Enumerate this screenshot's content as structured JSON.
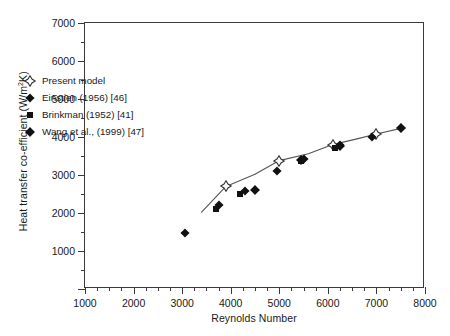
{
  "chart_data": {
    "type": "scatter",
    "title": "",
    "xlabel": "Reynolds Number",
    "ylabel": "Heat transfer co-efficient (W/m2K)",
    "ylabel_parts": {
      "pre": "Heat transfer co-efficient (W/m",
      "sup": "2",
      "post": "K)"
    },
    "xlim": [
      1000,
      8000
    ],
    "ylim": [
      0,
      7000
    ],
    "xticks": [
      1000,
      2000,
      3000,
      4000,
      5000,
      6000,
      7000,
      8000
    ],
    "yticks": [
      0,
      1000,
      2000,
      3000,
      4000,
      5000,
      6000,
      7000
    ],
    "xticklabels": [
      "1000",
      "2000",
      "3000",
      "4000",
      "5000",
      "6000",
      "7000",
      "8000"
    ],
    "yticklabels": [
      "",
      "1000",
      "2000",
      "3000",
      "4000",
      "5000",
      "6000",
      "7000"
    ],
    "xminor_step": 250,
    "yminor_step": 500,
    "grid": false,
    "legend_position": "upper-left-inside",
    "series": [
      {
        "name": "Present model",
        "marker": "open-four-point-star",
        "color": "#1a1a1a",
        "fill": "#ffffff",
        "points": [
          {
            "x": 3900,
            "y": 2700
          },
          {
            "x": 5000,
            "y": 3380
          },
          {
            "x": 6100,
            "y": 3800
          },
          {
            "x": 7000,
            "y": 4080
          }
        ]
      },
      {
        "name": "Einstien (1956) [46]",
        "marker": "filled-four-point-star",
        "color": "#111111",
        "points": [
          {
            "x": 3050,
            "y": 1480
          },
          {
            "x": 3750,
            "y": 2220
          },
          {
            "x": 4300,
            "y": 2580
          },
          {
            "x": 4950,
            "y": 3100
          },
          {
            "x": 5500,
            "y": 3430
          },
          {
            "x": 6250,
            "y": 3780
          },
          {
            "x": 6900,
            "y": 4000
          },
          {
            "x": 7500,
            "y": 4230
          }
        ]
      },
      {
        "name": "Brinkman (1952) [41]",
        "marker": "filled-square",
        "color": "#111111",
        "points": [
          {
            "x": 3700,
            "y": 2100
          },
          {
            "x": 4200,
            "y": 2500
          },
          {
            "x": 5450,
            "y": 3380
          },
          {
            "x": 6150,
            "y": 3700
          }
        ]
      },
      {
        "name": "Wang et al., (1999) [47]",
        "marker": "filled-diamond-star",
        "color": "#111111",
        "points": [
          {
            "x": 4500,
            "y": 2600
          },
          {
            "x": 5450,
            "y": 3400
          },
          {
            "x": 6250,
            "y": 3760
          },
          {
            "x": 7500,
            "y": 4230
          }
        ]
      }
    ],
    "trend_line": {
      "name": "model-trend-line",
      "color": "#555555",
      "points": [
        {
          "x": 3400,
          "y": 2020
        },
        {
          "x": 3900,
          "y": 2700
        },
        {
          "x": 4500,
          "y": 3020
        },
        {
          "x": 5000,
          "y": 3380
        },
        {
          "x": 5600,
          "y": 3560
        },
        {
          "x": 6100,
          "y": 3800
        },
        {
          "x": 6600,
          "y": 3950
        },
        {
          "x": 7000,
          "y": 4080
        },
        {
          "x": 7550,
          "y": 4240
        }
      ]
    }
  },
  "legend": {
    "items": [
      {
        "label": "Present model",
        "marker": "open-four-point-star"
      },
      {
        "label": "Einstien (1956) [46]",
        "marker": "filled-four-point-star"
      },
      {
        "label": "Brinkman (1952) [41]",
        "marker": "filled-square"
      },
      {
        "label": "Wang et al., (1999) [47]",
        "marker": "filled-diamond-star"
      }
    ]
  }
}
